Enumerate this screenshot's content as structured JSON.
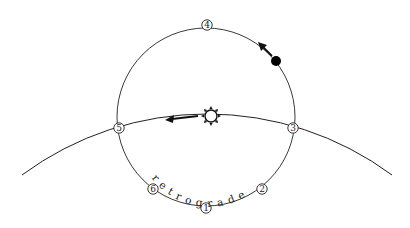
{
  "diagram": {
    "type": "epicycle-retrograde-motion",
    "colors": {
      "background": "#ffffff",
      "stroke": "#222222",
      "planet": "#000000"
    },
    "deferent": {
      "description": "large arc (deferent / ecliptic path)"
    },
    "epicycle": {
      "description": "small circle (epicycle)"
    },
    "sun": {
      "icon": "sun-icon",
      "direction": "left"
    },
    "planet": {
      "icon": "planet-dot",
      "direction": "up-left"
    },
    "positions": [
      {
        "id": "1",
        "label": "1"
      },
      {
        "id": "2",
        "label": "2"
      },
      {
        "id": "3",
        "label": "3"
      },
      {
        "id": "4",
        "label": "4"
      },
      {
        "id": "5",
        "label": "5"
      },
      {
        "id": "6",
        "label": "6"
      }
    ],
    "retrograde_label": "retrograde"
  }
}
